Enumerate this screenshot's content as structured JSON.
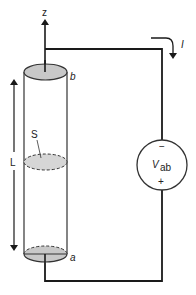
{
  "diagram": {
    "axis_label": "z",
    "top_end_label": "b",
    "bottom_end_label": "a",
    "cross_section_label": "S",
    "length_label": "L",
    "current_label": "I",
    "source": {
      "symbol": "V",
      "subscript": "ab",
      "top_terminal": "−",
      "bottom_terminal": "+"
    },
    "colors": {
      "wire": "#1a1a1a",
      "end_fill": "#c8c8c8",
      "section_fill": "#d6d6d6",
      "background": "#ffffff"
    }
  }
}
